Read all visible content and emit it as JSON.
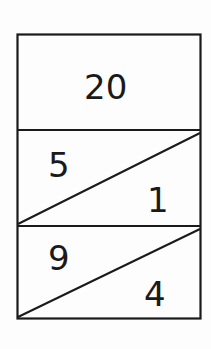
{
  "diagram": {
    "type": "tape-split-box",
    "colors": {
      "stroke": "#1a1a1a",
      "background": "#fdfdfd"
    },
    "top_cell": {
      "value": "20"
    },
    "split_cells": [
      {
        "upper_left": "5",
        "lower_right": "1"
      },
      {
        "upper_left": "9",
        "lower_right": "4"
      }
    ]
  }
}
